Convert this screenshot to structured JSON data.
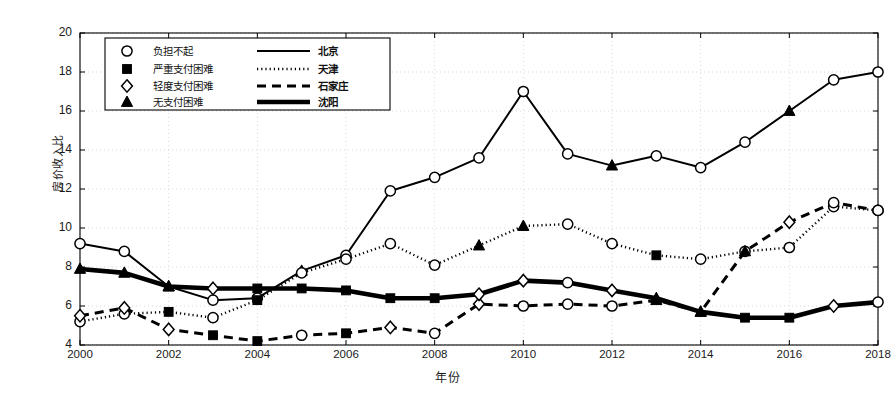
{
  "chart_data": {
    "type": "line",
    "title": "",
    "xlabel": "年份",
    "ylabel": "房价收入比",
    "xlim": [
      2000,
      2018
    ],
    "ylim": [
      4,
      20
    ],
    "ytick_step": 2,
    "xtick_step": 2,
    "grid": true,
    "legend_position": "top-left",
    "x": [
      2000,
      2001,
      2002,
      2003,
      2004,
      2005,
      2006,
      2007,
      2008,
      2009,
      2010,
      2011,
      2012,
      2013,
      2014,
      2015,
      2016,
      2017,
      2018
    ],
    "xticks": [
      "2000",
      "2002",
      "2004",
      "2006",
      "2008",
      "2010",
      "2012",
      "2014",
      "2016",
      "2018"
    ],
    "yticks": [
      "4",
      "6",
      "8",
      "10",
      "12",
      "14",
      "16",
      "18",
      "20"
    ],
    "series": [
      {
        "name": "北京",
        "style": "solid-thin",
        "values": [
          9.2,
          8.8,
          7.0,
          6.3,
          6.4,
          7.8,
          8.6,
          11.9,
          12.6,
          13.6,
          17.0,
          13.8,
          13.2,
          13.7,
          13.1,
          14.4,
          16.0,
          17.6,
          18.0
        ],
        "markers": [
          "affordable-not",
          "affordable-not",
          "no-difficulty",
          "affordable-not",
          "affordable-not",
          "no-difficulty",
          "affordable-not",
          "affordable-not",
          "affordable-not",
          "affordable-not",
          "affordable-not",
          "affordable-not",
          "no-difficulty",
          "affordable-not",
          "affordable-not",
          "affordable-not",
          "no-difficulty",
          "affordable-not",
          "affordable-not"
        ]
      },
      {
        "name": "天津",
        "style": "dotted",
        "values": [
          5.2,
          5.6,
          5.7,
          5.4,
          6.3,
          7.7,
          8.4,
          9.2,
          8.1,
          9.1,
          10.1,
          10.2,
          9.2,
          8.6,
          8.4,
          8.8,
          9.0,
          11.1,
          10.9
        ],
        "markers": [
          "affordable-not",
          "affordable-not",
          "severe-difficulty",
          "affordable-not",
          "severe-difficulty",
          "affordable-not",
          "affordable-not",
          "affordable-not",
          "affordable-not",
          "no-difficulty",
          "no-difficulty",
          "affordable-not",
          "affordable-not",
          "severe-difficulty",
          "affordable-not",
          "affordable-not",
          "affordable-not",
          "affordable-not",
          "affordable-not"
        ]
      },
      {
        "name": "石家庄",
        "style": "dashed",
        "values": [
          5.5,
          5.9,
          4.8,
          4.5,
          4.2,
          4.5,
          4.6,
          4.9,
          4.6,
          6.1,
          6.0,
          6.1,
          6.0,
          6.3,
          5.7,
          8.8,
          10.3,
          11.3,
          10.9
        ],
        "markers": [
          "mild-difficulty",
          "mild-difficulty",
          "mild-difficulty",
          "severe-difficulty",
          "severe-difficulty",
          "affordable-not",
          "severe-difficulty",
          "mild-difficulty",
          "affordable-not",
          "mild-difficulty",
          "affordable-not",
          "affordable-not",
          "affordable-not",
          "no-difficulty",
          "no-difficulty",
          "no-difficulty",
          "mild-difficulty",
          "affordable-not",
          "affordable-not"
        ]
      },
      {
        "name": "沈阳",
        "style": "solid-thick",
        "values": [
          7.9,
          7.7,
          7.0,
          6.9,
          6.9,
          6.9,
          6.8,
          6.4,
          6.4,
          6.6,
          7.3,
          7.2,
          6.8,
          6.4,
          5.7,
          5.4,
          5.4,
          6.0,
          6.2
        ],
        "markers": [
          "no-difficulty",
          "no-difficulty",
          "no-difficulty",
          "mild-difficulty",
          "severe-difficulty",
          "severe-difficulty",
          "severe-difficulty",
          "severe-difficulty",
          "severe-difficulty",
          "mild-difficulty",
          "mild-difficulty",
          "affordable-not",
          "mild-difficulty",
          "no-difficulty",
          "no-difficulty",
          "severe-difficulty",
          "severe-difficulty",
          "mild-difficulty",
          "affordable-not"
        ]
      }
    ],
    "legend": {
      "marker_entries": [
        {
          "marker": "circle-open",
          "label": "负担不起"
        },
        {
          "marker": "square-filled",
          "label": "严重支付困难"
        },
        {
          "marker": "diamond-open",
          "label": "轻度支付困难"
        },
        {
          "marker": "triangle-filled",
          "label": "无支付困难"
        }
      ],
      "line_entries": [
        {
          "style": "solid-thin",
          "label": "北京"
        },
        {
          "style": "dotted",
          "label": "天津"
        },
        {
          "style": "dashed",
          "label": "石家庄"
        },
        {
          "style": "solid-thick",
          "label": "沈阳"
        }
      ]
    },
    "colors": {
      "line": "#000000",
      "grid": "#c8c8c8",
      "axis": "#000000",
      "background": "#ffffff"
    }
  }
}
